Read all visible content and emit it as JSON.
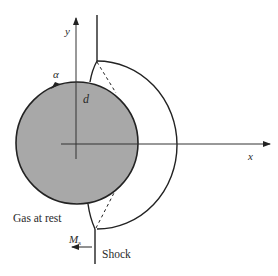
{
  "diagram": {
    "type": "shock-cylinder-reflection",
    "labels": {
      "y_axis": "y",
      "x_axis": "x",
      "alpha": "α",
      "d": "d",
      "gas_at_rest": "Gas at rest",
      "mach_symbol": "M",
      "mach_subscript": "s",
      "shock": "Shock"
    },
    "colors": {
      "cylinder_fill": "#a8a8a8",
      "stroke": "#222222",
      "background": "#ffffff"
    }
  }
}
